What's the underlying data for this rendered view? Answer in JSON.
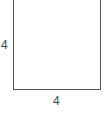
{
  "diagram": {
    "shape": "square",
    "stroke_color": "#555555",
    "fill_color": "#ffffff",
    "labels": {
      "left_side": "4",
      "bottom_side": "4"
    }
  }
}
